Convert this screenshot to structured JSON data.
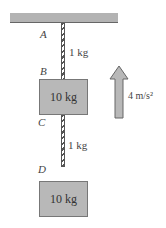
{
  "diagram": {
    "points": [
      "A",
      "B",
      "C",
      "D"
    ],
    "ropes": [
      {
        "id": "rope-AB",
        "mass": "1 kg"
      },
      {
        "id": "rope-CD",
        "mass": "1 kg"
      }
    ],
    "blocks": [
      {
        "id": "block-B",
        "mass": "10 kg"
      },
      {
        "id": "block-D",
        "mass": "10 kg"
      }
    ],
    "acceleration": {
      "label": "4 m/s²",
      "direction": "up"
    },
    "colors": {
      "block_fill": "#b8b8b8",
      "ceiling_fill": "#b3b3b3",
      "arrow_fill": "#b8b8b8"
    }
  }
}
